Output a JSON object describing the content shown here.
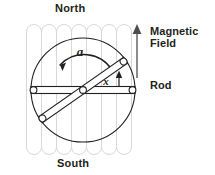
{
  "figure": {
    "title_top": "North",
    "title_bottom": "South",
    "annotations": {
      "magnetic_field_label": "Magnetic\nField",
      "rod_label": "Rod",
      "angular_accel_symbol": "a",
      "distance_symbol": "x"
    },
    "colors": {
      "stroke": "#231f20",
      "field_line": "#d7d8da",
      "text": "#231f20",
      "arrow": "#6d6e71",
      "background": "#ffffff"
    },
    "geometry": {
      "circle_center_x": 83,
      "circle_center_y": 90,
      "circle_radius": 52,
      "field_line_count": 8,
      "field_line_top": 27,
      "field_line_bottom": 152,
      "rod_angle_deg": 0,
      "tilted_rod_angle_deg": -35,
      "field_arrow_x": 137,
      "field_arrow_top": 25,
      "field_arrow_bottom": 78
    }
  }
}
